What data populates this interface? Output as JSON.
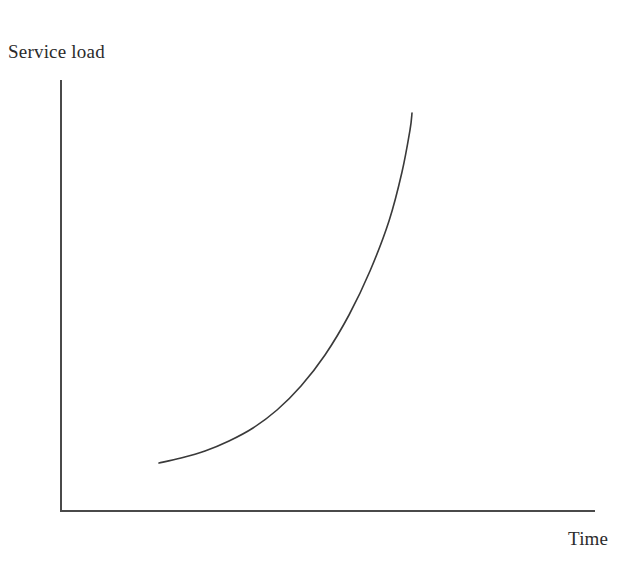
{
  "figure": {
    "width": 644,
    "height": 564,
    "background_color": "#ffffff"
  },
  "labels": {
    "ylabel": "Service load",
    "xlabel": "Time"
  },
  "style": {
    "axis_color": "#4a4a4a",
    "axis_width": 2,
    "curve_color": "#3a3a3a",
    "curve_width": 1.6,
    "text_color": "#2b2b2b"
  },
  "geometry": {
    "axis_origin_x": 61,
    "axis_origin_y": 512,
    "axis_top_y": 80,
    "axis_right_x": 595,
    "curve_start_x": 159,
    "curve_start_y": 463,
    "curve_end_x": 412,
    "curve_end_y": 113
  },
  "chart_data": {
    "type": "line",
    "title": "",
    "xlabel": "Time",
    "ylabel": "Service load",
    "xlim": [
      0,
      1
    ],
    "ylim": [
      0,
      1
    ],
    "grid": false,
    "legend": false,
    "axis_ticks": [],
    "tick_labels": [],
    "annotation": "Exponential growth of service load over time",
    "series": [
      {
        "name": "Service load",
        "comment": "Normalized axis coordinates; 0,0 at axis origin, 1,1 at axis extents. Monotonic convex (exponential) growth.",
        "x": [
          0.183,
          0.225,
          0.27,
          0.315,
          0.36,
          0.405,
          0.45,
          0.495,
          0.54,
          0.58,
          0.615,
          0.64,
          0.655,
          0.66
        ],
        "y": [
          0.113,
          0.125,
          0.142,
          0.165,
          0.196,
          0.238,
          0.293,
          0.365,
          0.458,
          0.56,
          0.676,
          0.79,
          0.888,
          0.924
        ]
      }
    ],
    "pixel_path": [
      [
        159,
        463
      ],
      [
        181,
        458
      ],
      [
        205,
        451
      ],
      [
        229,
        441
      ],
      [
        253,
        428
      ],
      [
        277,
        410
      ],
      [
        301,
        386
      ],
      [
        325,
        355
      ],
      [
        349,
        315
      ],
      [
        370,
        271
      ],
      [
        389,
        221
      ],
      [
        402,
        172
      ],
      [
        410,
        130
      ],
      [
        412,
        113
      ]
    ]
  }
}
